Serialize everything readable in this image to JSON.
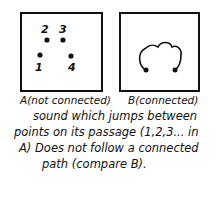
{
  "diagram": {
    "panel_a": {
      "caption": "A(not connected)",
      "points": [
        {
          "label": "1",
          "x": 40,
          "y": 55
        },
        {
          "label": "2",
          "x": 47,
          "y": 40
        },
        {
          "label": "3",
          "x": 63,
          "y": 40
        },
        {
          "label": "4",
          "x": 71,
          "y": 56
        }
      ]
    },
    "panel_b": {
      "caption": "B(connected)"
    },
    "description": [
      "sound which jumps between",
      "points on its passage (1,2,3... in",
      "A) Does not follow a connected",
      "path (compare B)."
    ]
  }
}
